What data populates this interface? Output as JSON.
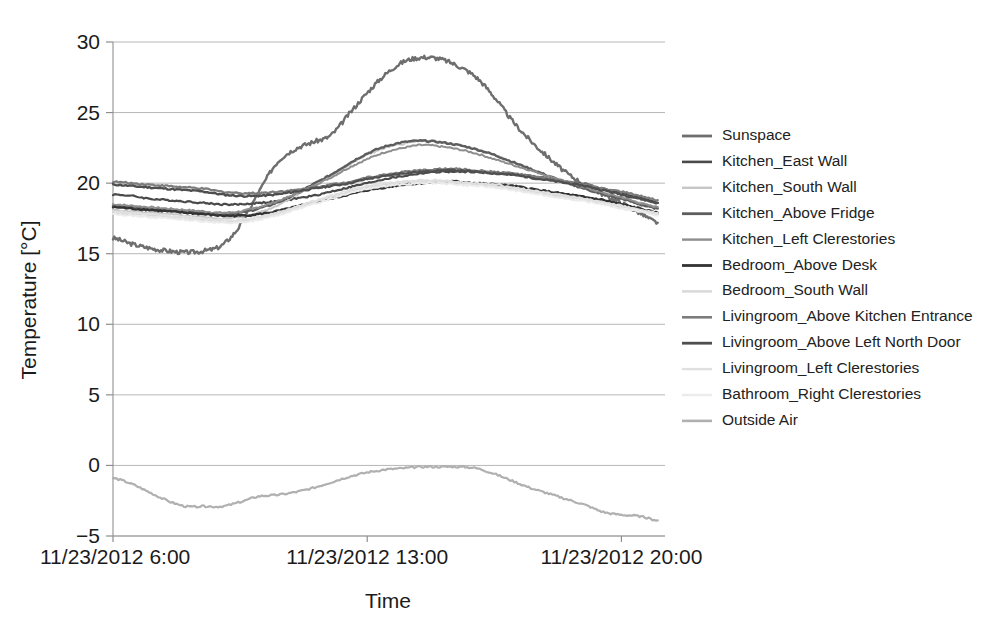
{
  "chart_data": {
    "type": "line",
    "title": "",
    "xlabel": "Time",
    "ylabel": "Temperature [°C]",
    "ylim": [
      -5,
      30
    ],
    "yticks": [
      -5,
      0,
      5,
      10,
      15,
      20,
      25,
      30
    ],
    "ytick_labels": [
      "−5",
      "0",
      "5",
      "10",
      "15",
      "20",
      "25",
      "30"
    ],
    "xlim": [
      6,
      21.2
    ],
    "xticks": [
      6,
      13,
      20
    ],
    "xtick_labels": [
      "11/23/2012 6:00",
      "11/23/2012 13:00",
      "11/23/2012 20:00"
    ],
    "grid": "horizontal",
    "legend_position": "right",
    "x": [
      6.0,
      6.5,
      7.0,
      7.5,
      8.0,
      8.5,
      9.0,
      9.5,
      10.0,
      10.5,
      11.0,
      11.5,
      12.0,
      12.5,
      13.0,
      13.5,
      14.0,
      14.5,
      15.0,
      15.5,
      16.0,
      16.5,
      17.0,
      17.5,
      18.0,
      18.5,
      19.0,
      19.5,
      20.0,
      20.5,
      21.0
    ],
    "series": [
      {
        "name": "Sunspace",
        "color": "#6e6e6e",
        "width": 2.4,
        "values": [
          16.1,
          15.7,
          15.4,
          15.2,
          15.1,
          15.2,
          15.6,
          17.0,
          19.3,
          21.4,
          22.4,
          22.9,
          23.4,
          24.9,
          26.4,
          27.7,
          28.6,
          28.9,
          28.8,
          28.3,
          27.5,
          26.1,
          24.4,
          23.0,
          21.8,
          20.7,
          19.9,
          19.2,
          18.6,
          17.9,
          17.2
        ]
      },
      {
        "name": "Kitchen_East Wall",
        "color": "#4a4a4a",
        "width": 2.2,
        "values": [
          19.2,
          19.1,
          18.9,
          18.8,
          18.7,
          18.6,
          18.5,
          18.5,
          18.6,
          18.7,
          18.9,
          19.1,
          19.4,
          19.7,
          20.0,
          20.3,
          20.5,
          20.7,
          20.8,
          20.8,
          20.8,
          20.7,
          20.6,
          20.5,
          20.3,
          20.1,
          19.9,
          19.6,
          19.3,
          19.0,
          18.6
        ]
      },
      {
        "name": "Kitchen_South Wall",
        "color": "#c6c6c6",
        "width": 2.0,
        "values": [
          18.1,
          18.0,
          17.9,
          17.8,
          17.7,
          17.6,
          17.5,
          17.6,
          17.9,
          18.4,
          19.1,
          19.8,
          20.5,
          21.3,
          22.0,
          22.5,
          22.8,
          23.0,
          22.9,
          22.7,
          22.4,
          22.0,
          21.5,
          21.0,
          20.5,
          20.1,
          19.7,
          19.3,
          19.0,
          18.6,
          18.3
        ]
      },
      {
        "name": "Kitchen_Above Fridge",
        "color": "#5d5d5d",
        "width": 2.4,
        "values": [
          18.4,
          18.3,
          18.2,
          18.1,
          18.0,
          17.9,
          17.8,
          17.9,
          18.2,
          18.6,
          19.2,
          19.9,
          20.6,
          21.4,
          22.1,
          22.6,
          22.9,
          23.0,
          22.9,
          22.7,
          22.4,
          22.0,
          21.5,
          21.0,
          20.5,
          20.0,
          19.6,
          19.2,
          18.9,
          18.5,
          18.2
        ]
      },
      {
        "name": "Kitchen_Left Clerestories",
        "color": "#8e8e8e",
        "width": 2.0,
        "values": [
          18.5,
          18.4,
          18.3,
          18.2,
          18.1,
          18.0,
          17.9,
          18.0,
          18.3,
          18.7,
          19.2,
          19.8,
          20.4,
          21.1,
          21.7,
          22.2,
          22.5,
          22.7,
          22.6,
          22.4,
          22.1,
          21.7,
          21.3,
          20.9,
          20.5,
          20.1,
          19.7,
          19.3,
          19.0,
          18.6,
          18.3
        ]
      },
      {
        "name": "Bedroom_Above Desk",
        "color": "#333333",
        "width": 2.4,
        "values": [
          18.3,
          18.2,
          18.1,
          18.0,
          17.9,
          17.8,
          17.7,
          17.7,
          17.8,
          18.0,
          18.3,
          18.6,
          18.9,
          19.2,
          19.5,
          19.7,
          19.9,
          20.0,
          20.1,
          20.1,
          20.0,
          19.9,
          19.8,
          19.6,
          19.4,
          19.2,
          19.0,
          18.8,
          18.5,
          18.2,
          17.9
        ]
      },
      {
        "name": "Bedroom_South Wall",
        "color": "#d8d8d8",
        "width": 2.0,
        "values": [
          17.9,
          17.8,
          17.7,
          17.6,
          17.5,
          17.4,
          17.3,
          17.3,
          17.5,
          17.8,
          18.2,
          18.6,
          19.0,
          19.4,
          19.7,
          19.9,
          20.1,
          20.1,
          20.1,
          20.0,
          19.9,
          19.8,
          19.6,
          19.4,
          19.2,
          19.0,
          18.8,
          18.6,
          18.3,
          18.1,
          17.8
        ]
      },
      {
        "name": "Livingroom_Above Kitchen Entrance",
        "color": "#7c7c7c",
        "width": 2.2,
        "values": [
          20.1,
          20.0,
          19.9,
          19.8,
          19.7,
          19.6,
          19.4,
          19.3,
          19.3,
          19.4,
          19.5,
          19.7,
          19.9,
          20.1,
          20.4,
          20.6,
          20.8,
          20.9,
          21.0,
          21.0,
          20.9,
          20.8,
          20.7,
          20.5,
          20.3,
          20.1,
          19.9,
          19.6,
          19.4,
          19.1,
          18.8
        ]
      },
      {
        "name": "Livingroom_Above Left North Door",
        "color": "#4f4f4f",
        "width": 2.4,
        "values": [
          19.9,
          19.8,
          19.7,
          19.6,
          19.5,
          19.4,
          19.2,
          19.1,
          19.1,
          19.2,
          19.4,
          19.6,
          19.8,
          20.0,
          20.3,
          20.5,
          20.7,
          20.8,
          20.9,
          20.9,
          20.8,
          20.7,
          20.6,
          20.4,
          20.2,
          20.0,
          19.8,
          19.5,
          19.2,
          18.9,
          18.6
        ]
      },
      {
        "name": "Livingroom_Left Clerestories",
        "color": "#e0e0e0",
        "width": 2.0,
        "values": [
          18.0,
          17.9,
          17.8,
          17.7,
          17.6,
          17.5,
          17.4,
          17.4,
          17.6,
          17.9,
          18.3,
          18.7,
          19.1,
          19.5,
          19.8,
          20.0,
          20.1,
          20.2,
          20.2,
          20.1,
          20.0,
          19.9,
          19.7,
          19.5,
          19.3,
          19.1,
          18.9,
          18.6,
          18.4,
          18.1,
          17.9
        ]
      },
      {
        "name": "Bathroom_Right Clerestories",
        "color": "#ebebeb",
        "width": 2.0,
        "values": [
          17.8,
          17.7,
          17.6,
          17.5,
          17.4,
          17.3,
          17.2,
          17.2,
          17.4,
          17.7,
          18.1,
          18.5,
          18.9,
          19.3,
          19.6,
          19.8,
          19.9,
          20.0,
          20.0,
          19.9,
          19.8,
          19.7,
          19.5,
          19.3,
          19.1,
          18.9,
          18.7,
          18.5,
          18.2,
          18.0,
          17.7
        ]
      },
      {
        "name": "Outside Air",
        "color": "#b0b0b0",
        "width": 2.2,
        "values": [
          -0.9,
          -1.3,
          -1.9,
          -2.5,
          -2.9,
          -2.9,
          -2.9,
          -2.6,
          -2.2,
          -2.1,
          -1.9,
          -1.6,
          -1.2,
          -0.8,
          -0.5,
          -0.3,
          -0.2,
          -0.1,
          -0.1,
          -0.1,
          -0.2,
          -0.6,
          -1.1,
          -1.6,
          -2.0,
          -2.4,
          -2.8,
          -3.3,
          -3.5,
          -3.6,
          -3.9
        ]
      }
    ]
  },
  "legend": {
    "entries": [
      {
        "label": "Sunspace"
      },
      {
        "label": "Kitchen_East Wall"
      },
      {
        "label": "Kitchen_South Wall"
      },
      {
        "label": "Kitchen_Above Fridge"
      },
      {
        "label": "Kitchen_Left Clerestories"
      },
      {
        "label": "Bedroom_Above Desk"
      },
      {
        "label": "Bedroom_South Wall"
      },
      {
        "label": "Livingroom_Above Kitchen Entrance"
      },
      {
        "label": "Livingroom_Above Left North Door"
      },
      {
        "label": "Livingroom_Left Clerestories"
      },
      {
        "label": "Bathroom_Right Clerestories"
      },
      {
        "label": "Outside Air"
      }
    ]
  }
}
